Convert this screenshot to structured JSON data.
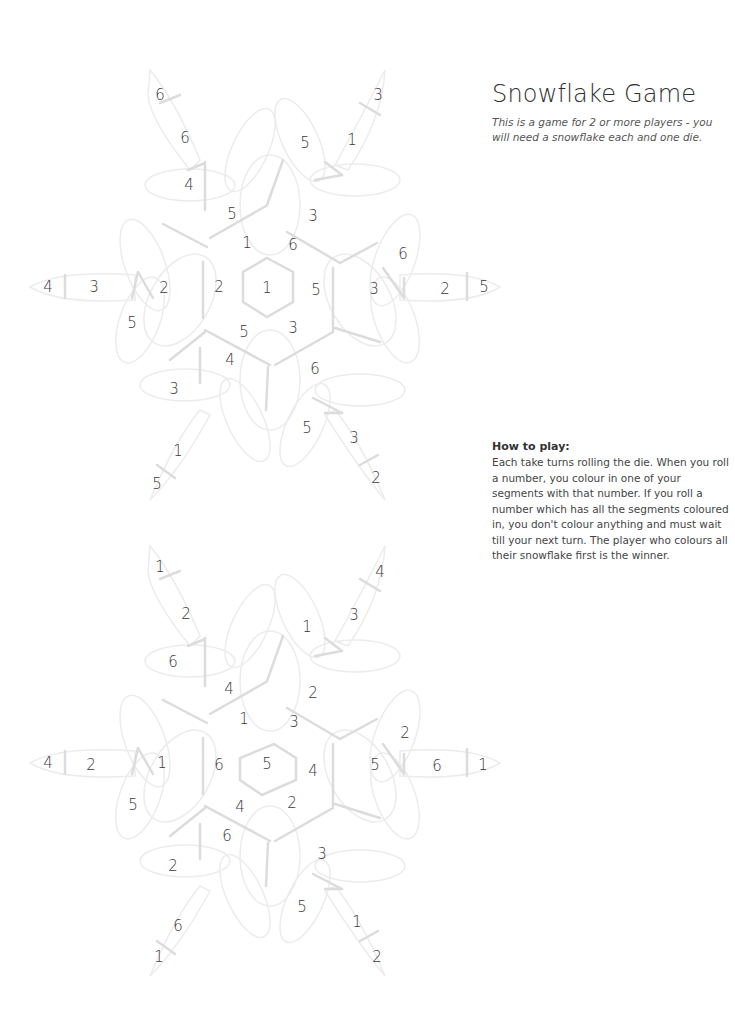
{
  "title": "Snowflake Game",
  "intro": "This is a game for 2 or more players - you will need a snowflake each and one die.",
  "how_to_play": {
    "heading": "How to play:",
    "text": "Each take turns rolling the die. When you roll a number, you colour in one of your segments with that number. If you roll a number which has all the segments coloured in, you don't colour anything and must wait till your next turn. The player who colours all their snowflake first is the winner."
  },
  "colors": {
    "line": "#dcdcdc",
    "outline": "#ececec",
    "text": "#3a3a3a"
  },
  "snowflakes": [
    {
      "name": "snowflake-1",
      "numbers": [
        {
          "v": "6",
          "x": 160,
          "y": 95
        },
        {
          "v": "6",
          "x": 185,
          "y": 138
        },
        {
          "v": "4",
          "x": 189,
          "y": 185
        },
        {
          "v": "3",
          "x": 378,
          "y": 95
        },
        {
          "v": "1",
          "x": 352,
          "y": 140
        },
        {
          "v": "5",
          "x": 305,
          "y": 143
        },
        {
          "v": "5",
          "x": 232,
          "y": 214
        },
        {
          "v": "3",
          "x": 313,
          "y": 216
        },
        {
          "v": "1",
          "x": 247,
          "y": 243
        },
        {
          "v": "6",
          "x": 293,
          "y": 245
        },
        {
          "v": "4",
          "x": 48,
          "y": 287
        },
        {
          "v": "3",
          "x": 94,
          "y": 287
        },
        {
          "v": "2",
          "x": 164,
          "y": 288
        },
        {
          "v": "2",
          "x": 219,
          "y": 287
        },
        {
          "v": "1",
          "x": 267,
          "y": 288
        },
        {
          "v": "5",
          "x": 316,
          "y": 290
        },
        {
          "v": "3",
          "x": 374,
          "y": 289
        },
        {
          "v": "6",
          "x": 403,
          "y": 254
        },
        {
          "v": "2",
          "x": 445,
          "y": 289
        },
        {
          "v": "5",
          "x": 484,
          "y": 287
        },
        {
          "v": "5",
          "x": 132,
          "y": 323
        },
        {
          "v": "5",
          "x": 244,
          "y": 332
        },
        {
          "v": "3",
          "x": 293,
          "y": 328
        },
        {
          "v": "4",
          "x": 230,
          "y": 360
        },
        {
          "v": "6",
          "x": 315,
          "y": 369
        },
        {
          "v": "3",
          "x": 174,
          "y": 389
        },
        {
          "v": "5",
          "x": 307,
          "y": 428
        },
        {
          "v": "3",
          "x": 354,
          "y": 438
        },
        {
          "v": "1",
          "x": 178,
          "y": 451
        },
        {
          "v": "5",
          "x": 157,
          "y": 484
        },
        {
          "v": "2",
          "x": 376,
          "y": 478
        }
      ]
    },
    {
      "name": "snowflake-2",
      "numbers": [
        {
          "v": "1",
          "x": 160,
          "y": 567
        },
        {
          "v": "2",
          "x": 186,
          "y": 614
        },
        {
          "v": "6",
          "x": 173,
          "y": 662
        },
        {
          "v": "4",
          "x": 380,
          "y": 572
        },
        {
          "v": "3",
          "x": 354,
          "y": 615
        },
        {
          "v": "1",
          "x": 307,
          "y": 627
        },
        {
          "v": "4",
          "x": 229,
          "y": 689
        },
        {
          "v": "2",
          "x": 313,
          "y": 693
        },
        {
          "v": "1",
          "x": 244,
          "y": 719
        },
        {
          "v": "3",
          "x": 294,
          "y": 722
        },
        {
          "v": "4",
          "x": 48,
          "y": 763
        },
        {
          "v": "2",
          "x": 91,
          "y": 765
        },
        {
          "v": "1",
          "x": 162,
          "y": 763
        },
        {
          "v": "6",
          "x": 219,
          "y": 765
        },
        {
          "v": "5",
          "x": 267,
          "y": 764
        },
        {
          "v": "4",
          "x": 313,
          "y": 771
        },
        {
          "v": "5",
          "x": 375,
          "y": 765
        },
        {
          "v": "2",
          "x": 405,
          "y": 733
        },
        {
          "v": "6",
          "x": 437,
          "y": 766
        },
        {
          "v": "1",
          "x": 483,
          "y": 765
        },
        {
          "v": "5",
          "x": 133,
          "y": 805
        },
        {
          "v": "4",
          "x": 240,
          "y": 807
        },
        {
          "v": "2",
          "x": 292,
          "y": 803
        },
        {
          "v": "6",
          "x": 227,
          "y": 836
        },
        {
          "v": "3",
          "x": 322,
          "y": 854
        },
        {
          "v": "2",
          "x": 173,
          "y": 866
        },
        {
          "v": "5",
          "x": 302,
          "y": 907
        },
        {
          "v": "1",
          "x": 357,
          "y": 922
        },
        {
          "v": "6",
          "x": 178,
          "y": 926
        },
        {
          "v": "1",
          "x": 159,
          "y": 957
        },
        {
          "v": "2",
          "x": 377,
          "y": 957
        }
      ]
    }
  ]
}
